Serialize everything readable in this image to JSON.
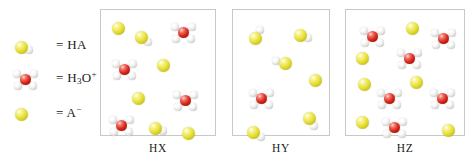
{
  "figure": {
    "type": "molecular-level-diagram"
  },
  "legend": {
    "items": [
      {
        "name": "acid-molecule",
        "glyph": "yellow-sphere-with-one-white-sphere",
        "equals": "=",
        "formula_html": "HA",
        "formula_text": "HA"
      },
      {
        "name": "hydronium-ion",
        "glyph": "red-sphere-with-three-white-spheres",
        "equals": "=",
        "formula_html": "H<sub>3</sub>O<sup>+</sup>",
        "formula_text": "H3O+"
      },
      {
        "name": "conjugate-base-anion",
        "glyph": "yellow-sphere",
        "equals": "=",
        "formula_html": "A<sup>&minus;</sup>",
        "formula_text": "A-"
      }
    ]
  },
  "colors": {
    "acid_yellow": "#eae23f",
    "oxygen_red": "#d92a1c",
    "hydrogen_white": "#f2f2f0",
    "box_border": "#c8c8c8",
    "background": "#ffffff",
    "text": "#1a1a1a"
  },
  "chart_data": {
    "type": "diagram",
    "title": "",
    "panels": [
      {
        "label": "HX",
        "counts": {
          "HA": 2,
          "H3O+": 4,
          "A-": 5
        },
        "species": [
          {
            "kind": "A-",
            "x": 17,
            "y": 18
          },
          {
            "kind": "HA",
            "x": 40,
            "y": 27,
            "h_angle": 35
          },
          {
            "kind": "H3O+",
            "x": 82,
            "y": 22
          },
          {
            "kind": "H3O+",
            "x": 23,
            "y": 59
          },
          {
            "kind": "A-",
            "x": 62,
            "y": 55
          },
          {
            "kind": "A-",
            "x": 37,
            "y": 88
          },
          {
            "kind": "H3O+",
            "x": 84,
            "y": 90
          },
          {
            "kind": "H3O+",
            "x": 20,
            "y": 115
          },
          {
            "kind": "HA",
            "x": 54,
            "y": 118,
            "h_angle": 20
          },
          {
            "kind": "A-",
            "x": 87,
            "y": 123
          }
        ]
      },
      {
        "label": "HY",
        "counts": {
          "HA": 5,
          "H3O+": 1,
          "A-": 2
        },
        "species": [
          {
            "kind": "HA",
            "x": 22,
            "y": 28,
            "h_angle": 300
          },
          {
            "kind": "HA",
            "x": 67,
            "y": 25,
            "h_angle": 20
          },
          {
            "kind": "HA",
            "x": 52,
            "y": 53,
            "h_angle": 190
          },
          {
            "kind": "A-",
            "x": 82,
            "y": 70
          },
          {
            "kind": "H3O+",
            "x": 28,
            "y": 88
          },
          {
            "kind": "HA",
            "x": 76,
            "y": 108,
            "h_angle": 60
          },
          {
            "kind": "HA",
            "x": 20,
            "y": 122,
            "h_angle": 30
          }
        ]
      },
      {
        "label": "HZ",
        "counts": {
          "HA": 0,
          "H3O+": 6,
          "A-": 6
        },
        "species": [
          {
            "kind": "H3O+",
            "x": 26,
            "y": 26
          },
          {
            "kind": "A-",
            "x": 66,
            "y": 18
          },
          {
            "kind": "H3O+",
            "x": 97,
            "y": 28
          },
          {
            "kind": "A-",
            "x": 16,
            "y": 48
          },
          {
            "kind": "H3O+",
            "x": 63,
            "y": 48
          },
          {
            "kind": "A-",
            "x": 18,
            "y": 74
          },
          {
            "kind": "A-",
            "x": 70,
            "y": 72
          },
          {
            "kind": "H3O+",
            "x": 43,
            "y": 88
          },
          {
            "kind": "H3O+",
            "x": 96,
            "y": 88
          },
          {
            "kind": "A-",
            "x": 16,
            "y": 112
          },
          {
            "kind": "H3O+",
            "x": 48,
            "y": 117
          },
          {
            "kind": "A-",
            "x": 102,
            "y": 120
          }
        ]
      }
    ]
  }
}
